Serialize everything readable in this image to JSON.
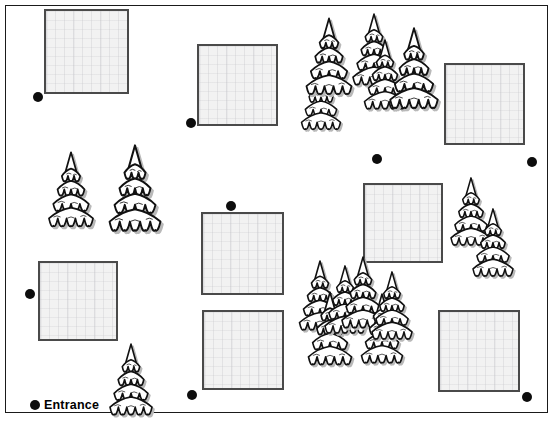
{
  "map": {
    "title": "Campsite site plan",
    "width": 556,
    "height": 422,
    "background_color": "#ffffff",
    "frame": {
      "x": 5,
      "y": 5,
      "width": 543,
      "height": 408,
      "border_color": "#1a1a1a"
    }
  },
  "legend": {
    "entrance_label": "Entrance",
    "entrance_marker": {
      "x": 30,
      "y": 400
    }
  },
  "style": {
    "plot_fill": "#f2f2f2",
    "plot_border": "#4a4a4a",
    "dot_color": "#0d0d0d",
    "tree_outline": "#111111",
    "tree_fill": "#ffffff",
    "tree_shadow": "#b9b9b9"
  },
  "plots": [
    {
      "name": "plot-top-left",
      "x": 44,
      "y": 9,
      "width": 85,
      "height": 85
    },
    {
      "name": "plot-top-mid-left",
      "x": 197,
      "y": 44,
      "width": 81,
      "height": 82
    },
    {
      "name": "plot-top-right",
      "x": 444,
      "y": 63,
      "width": 81,
      "height": 82
    },
    {
      "name": "plot-mid-left",
      "x": 38,
      "y": 261,
      "width": 80,
      "height": 80
    },
    {
      "name": "plot-mid-center",
      "x": 201,
      "y": 212,
      "width": 83,
      "height": 83
    },
    {
      "name": "plot-mid-right",
      "x": 363,
      "y": 183,
      "width": 80,
      "height": 80
    },
    {
      "name": "plot-bottom-center",
      "x": 202,
      "y": 310,
      "width": 82,
      "height": 80
    },
    {
      "name": "plot-bottom-right",
      "x": 438,
      "y": 310,
      "width": 82,
      "height": 82
    }
  ],
  "dots": [
    {
      "name": "marker-top-left",
      "x": 33,
      "y": 92
    },
    {
      "name": "marker-top-mid-left",
      "x": 186,
      "y": 118
    },
    {
      "name": "marker-center-top",
      "x": 372,
      "y": 154
    },
    {
      "name": "marker-right-edge",
      "x": 527,
      "y": 157
    },
    {
      "name": "marker-mid-center-top",
      "x": 226,
      "y": 201
    },
    {
      "name": "marker-mid-left",
      "x": 25,
      "y": 289
    },
    {
      "name": "marker-bottom-mid-left",
      "x": 187,
      "y": 390
    },
    {
      "name": "marker-bottom-right",
      "x": 522,
      "y": 392
    },
    {
      "name": "marker-entrance",
      "x": 30,
      "y": 400
    }
  ],
  "trees": [
    {
      "name": "tree-left-small",
      "x": 44,
      "y": 148,
      "w": 54,
      "h": 86
    },
    {
      "name": "tree-left-tall",
      "x": 104,
      "y": 140,
      "w": 62,
      "h": 100
    },
    {
      "name": "tree-cluster-top-a",
      "x": 292,
      "y": 60,
      "w": 58,
      "h": 76
    },
    {
      "name": "tree-cluster-top-b",
      "x": 298,
      "y": 14,
      "w": 62,
      "h": 88
    },
    {
      "name": "tree-cluster-top-c",
      "x": 345,
      "y": 10,
      "w": 58,
      "h": 82
    },
    {
      "name": "tree-cluster-top-d",
      "x": 357,
      "y": 36,
      "w": 56,
      "h": 80
    },
    {
      "name": "tree-cluster-top-e",
      "x": 385,
      "y": 12,
      "w": 58,
      "h": 116
    },
    {
      "name": "tree-right-upper-a",
      "x": 444,
      "y": 174,
      "w": 54,
      "h": 78
    },
    {
      "name": "tree-right-upper-b",
      "x": 466,
      "y": 205,
      "w": 54,
      "h": 78
    },
    {
      "name": "tree-cluster-mid-a",
      "x": 292,
      "y": 257,
      "w": 56,
      "h": 80
    },
    {
      "name": "tree-cluster-mid-b",
      "x": 302,
      "y": 288,
      "w": 56,
      "h": 84
    },
    {
      "name": "tree-cluster-mid-c",
      "x": 318,
      "y": 262,
      "w": 54,
      "h": 78
    },
    {
      "name": "tree-cluster-mid-d",
      "x": 334,
      "y": 253,
      "w": 58,
      "h": 82
    },
    {
      "name": "tree-cluster-mid-e",
      "x": 355,
      "y": 290,
      "w": 54,
      "h": 80
    },
    {
      "name": "tree-cluster-mid-f",
      "x": 366,
      "y": 268,
      "w": 52,
      "h": 78
    },
    {
      "name": "tree-entrance",
      "x": 103,
      "y": 340,
      "w": 56,
      "h": 82
    }
  ]
}
